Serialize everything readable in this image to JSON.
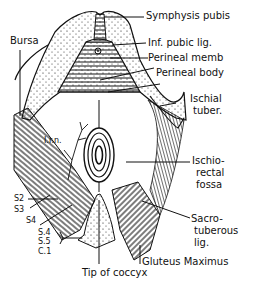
{
  "diagram": {
    "type": "anatomical-illustration",
    "line_color": "#111111",
    "background": "#ffffff",
    "labels": {
      "symphysis_pubis": "Symphysis pubis",
      "bursa": "Bursa",
      "inf_pubic_lig": "Inf. pubic lig.",
      "perineal_memb": "Perineal memb",
      "perineal_body": "Perineal body",
      "ischial_tuber_1": "Ischial",
      "ischial_tuber_2": "tuber.",
      "inn": "I.r.n.",
      "ischiorectal_1": "Ischio-",
      "ischiorectal_2": "rectal",
      "ischiorectal_3": "fossa",
      "s2": "S2",
      "s3": "S3",
      "s4": "S4",
      "s4b": "S.4",
      "s5": "S.5",
      "c1": "C.1",
      "sacrotuberous_1": "Sacro-",
      "sacrotuberous_2": "tuberous",
      "sacrotuberous_3": "lig.",
      "gluteus_maximus": "Gluteus Maximus",
      "tip_of_coccyx": "Tip of coccyx"
    }
  }
}
